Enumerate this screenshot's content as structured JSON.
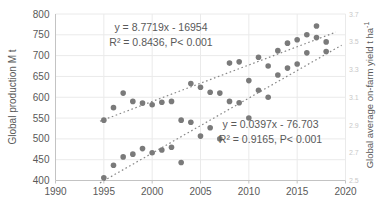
{
  "labels": {
    "eq1_line1": "y = 8.7719x - 16954",
    "eq1_line2": "R² = 0.8436, P< 0.001",
    "eq2_line1": "y = 0.0397x - 76.703",
    "eq2_line2": "R² = 0.9165, P< 0.001"
  },
  "axes": {
    "ylabel_left": "Global production M t",
    "ylabel_right_main": "Global average on-farm yield t ha",
    "ylabel_right_sup": "-1"
  },
  "chart_data": {
    "type": "scatter",
    "title": "",
    "xlabel": "",
    "ylabel_left": "Global production M t",
    "ylabel_right": "Global average on-farm yield t ha⁻¹",
    "grid": true,
    "legend": "none",
    "xlim": [
      1990,
      2020
    ],
    "xticks": [
      1990,
      1995,
      2000,
      2005,
      2010,
      2015,
      2020
    ],
    "ylim_left": [
      400,
      800
    ],
    "yticks_left": [
      400,
      450,
      500,
      550,
      600,
      650,
      700,
      750,
      800
    ],
    "ylim_right": [
      2.5,
      3.7
    ],
    "yticks_right": [
      2.5,
      2.7,
      2.9,
      3.1,
      3.3,
      3.5,
      3.7
    ],
    "x_years": [
      1995,
      1996,
      1997,
      1998,
      1999,
      2000,
      2001,
      2002,
      2003,
      2004,
      2005,
      2006,
      2007,
      2008,
      2009,
      2010,
      2011,
      2012,
      2013,
      2014,
      2015,
      2016,
      2017,
      2018
    ],
    "series": [
      {
        "name": "Global production",
        "unit": "M t",
        "axis": "left",
        "values": [
          545,
          575,
          610,
          590,
          586,
          582,
          588,
          590,
          545,
          633,
          624,
          612,
          610,
          682,
          685,
          640,
          696,
          675,
          712,
          730,
          738,
          750,
          771,
          733
        ]
      },
      {
        "name": "Global average on-farm yield",
        "unit": "t ha-1",
        "axis": "right",
        "values": [
          2.52,
          2.61,
          2.67,
          2.69,
          2.73,
          2.7,
          2.72,
          2.74,
          2.63,
          2.92,
          2.82,
          2.88,
          2.8,
          3.07,
          3.06,
          2.95,
          3.15,
          3.1,
          3.26,
          3.31,
          3.34,
          3.42,
          3.53,
          3.43
        ]
      }
    ],
    "trendlines": [
      {
        "series": "Global production",
        "axis": "left",
        "slope": 8.7719,
        "intercept": -16954,
        "x_start": 1994.6,
        "x_end": 2019.0,
        "equation": "y = 8.7719x - 16954",
        "r_squared": 0.8436,
        "p_value": "P< 0.001",
        "style": "dotted"
      },
      {
        "series": "Global average on-farm yield",
        "axis": "right",
        "slope": 0.0397,
        "intercept": -76.703,
        "x_start": 1994.6,
        "x_end": 2019.6,
        "equation": "y = 0.0397x - 76.703",
        "r_squared": 0.9165,
        "p_value": "P< 0.001",
        "style": "dotted"
      }
    ],
    "colors": {
      "points": "#7a7a7a",
      "trendline": "#878787",
      "gridline": "#eaeaea",
      "axis_line": "#c3c3c3",
      "tick_text": "#595959",
      "right_tick_text": "#c9c9c9",
      "background": "#ffffff"
    }
  }
}
